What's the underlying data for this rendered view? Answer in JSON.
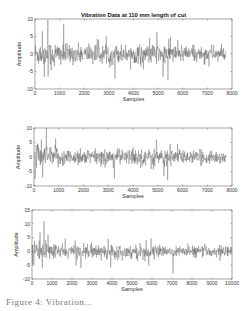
{
  "figure": {
    "caption": "Figure 4: Vibration..."
  },
  "chart_data": [
    {
      "type": "line",
      "title": "Vibration Data at 110 mm length of cut",
      "xlabel": "Samples",
      "ylabel": "Amplitude",
      "xlim": [
        0,
        8000
      ],
      "ylim": [
        -10,
        10
      ],
      "xticks": [
        0,
        1000,
        2000,
        3000,
        4000,
        5000,
        6000,
        7000,
        8000
      ],
      "yticks": [
        -10,
        -5,
        0,
        5,
        10
      ],
      "data_length": 7750,
      "noise_amplitude": 2.2,
      "peaks": [
        {
          "x": 300,
          "y": 6.5
        },
        {
          "x": 520,
          "y": 9.8
        },
        {
          "x": 380,
          "y": -6.5
        },
        {
          "x": 3250,
          "y": -7
        },
        {
          "x": 4950,
          "y": 6.2
        },
        {
          "x": 5400,
          "y": -7.5
        },
        {
          "x": 5500,
          "y": 4.8
        },
        {
          "x": 5800,
          "y": 4
        },
        {
          "x": 5200,
          "y": -6.5
        }
      ],
      "color": "#555555"
    },
    {
      "type": "line",
      "title": "",
      "xlabel": "Samples",
      "ylabel": "Amplitude",
      "xlim": [
        0,
        8000
      ],
      "ylim": [
        -10,
        10
      ],
      "xticks": [
        0,
        1000,
        2000,
        3000,
        4000,
        5000,
        6000,
        7000,
        8000
      ],
      "yticks": [
        -10,
        -5,
        0,
        5,
        10
      ],
      "data_length": 7750,
      "noise_amplitude": 2.2,
      "peaks": [
        {
          "x": 300,
          "y": 6
        },
        {
          "x": 500,
          "y": 10
        },
        {
          "x": 350,
          "y": -7
        },
        {
          "x": 3250,
          "y": -7.5
        },
        {
          "x": 4950,
          "y": 6
        },
        {
          "x": 5400,
          "y": -8
        },
        {
          "x": 5500,
          "y": 4.5
        },
        {
          "x": 5800,
          "y": 4.5
        },
        {
          "x": 5250,
          "y": -6.5
        }
      ],
      "color": "#555555"
    },
    {
      "type": "line",
      "title": "",
      "xlabel": "Samples",
      "ylabel": "Amplitude",
      "xlim": [
        0,
        10000
      ],
      "ylim": [
        -10,
        15
      ],
      "xticks": [
        0,
        1000,
        2000,
        3000,
        4000,
        5000,
        6000,
        7000,
        8000,
        9000,
        10000
      ],
      "yticks": [
        -10,
        -5,
        0,
        5,
        10,
        15
      ],
      "data_length": 10000,
      "noise_amplitude": 2.0,
      "peaks": [
        {
          "x": 400,
          "y": 7
        },
        {
          "x": 600,
          "y": 11
        },
        {
          "x": 800,
          "y": 6
        },
        {
          "x": 100,
          "y": -5
        },
        {
          "x": 7050,
          "y": -8
        },
        {
          "x": 3800,
          "y": 4.5
        }
      ],
      "color": "#555555"
    }
  ],
  "plots": [
    {
      "box": {
        "x": 35,
        "y": 19,
        "w": 197,
        "h": 70
      }
    },
    {
      "box": {
        "x": 34,
        "y": 128,
        "w": 198,
        "h": 58
      }
    },
    {
      "box": {
        "x": 32,
        "y": 210,
        "w": 200,
        "h": 69
      }
    }
  ]
}
